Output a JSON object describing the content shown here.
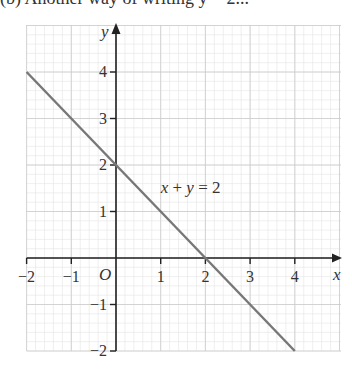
{
  "caption": "(b) Another way of writing y = 2...",
  "chart_data": {
    "type": "line",
    "title": "",
    "xlabel": "x",
    "ylabel": "y",
    "origin_label": "O",
    "xlim": [
      -2,
      4.5
    ],
    "ylim": [
      -2,
      5
    ],
    "x_ticks": [
      -2,
      -1,
      1,
      2,
      3,
      4
    ],
    "x_tick_labels": [
      "−2",
      "−1",
      "1",
      "2",
      "3",
      "4"
    ],
    "y_ticks": [
      4,
      3,
      2,
      1,
      -1,
      -2
    ],
    "y_tick_labels": [
      "4",
      "3",
      "2",
      "1",
      "−1",
      "−2"
    ],
    "grid": true,
    "minor_grid_subdivisions": 5,
    "series": [
      {
        "name": "x + y = 2",
        "x": [
          -2,
          4
        ],
        "y": [
          4,
          -2
        ],
        "color": "#777777"
      }
    ],
    "annotations": [
      {
        "text": "x + y = 2",
        "x": 1,
        "y": 1.4
      }
    ]
  }
}
